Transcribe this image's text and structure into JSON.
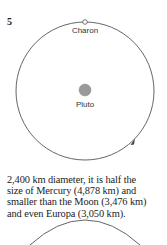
{
  "figure": {
    "number": "5",
    "labels": {
      "moon": "Charon",
      "planet": "Pluto"
    }
  },
  "paragraph": {
    "lines": [
      "2,400 km diameter, it is half the",
      "size of Mercury (4,878 km) and",
      "smaller than the Moon (3,476 km)",
      "and even Europa (3,050 km)."
    ]
  }
}
